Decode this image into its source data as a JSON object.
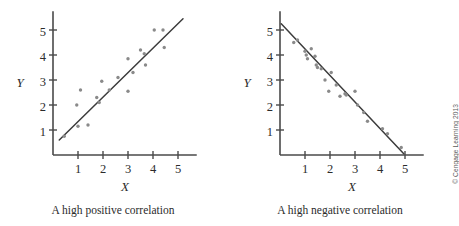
{
  "figure": {
    "background": "#ffffff",
    "axis_color": "#4a4a4a",
    "point_color": "#8a8a8a",
    "line_color": "#3c3c3c",
    "credit": "© Cengage Learning 2013"
  },
  "panels": [
    {
      "id": "left",
      "caption": "A high positive correlation",
      "xlabel": "X",
      "ylabel": "Y"
    },
    {
      "id": "right",
      "caption": "A high negative correlation",
      "xlabel": "X",
      "ylabel": "Y"
    }
  ],
  "chart_data": [
    {
      "type": "scatter",
      "title": "A high positive correlation",
      "xlabel": "X",
      "ylabel": "Y",
      "xlim": [
        0,
        5.6
      ],
      "ylim": [
        0,
        5.6
      ],
      "xticks": [
        "1",
        "2",
        "3",
        "4",
        "5"
      ],
      "yticks": [
        "1",
        "2",
        "3",
        "4",
        "5"
      ],
      "xtick_values": [
        1,
        2,
        3,
        4,
        5
      ],
      "ytick_values": [
        1,
        2,
        3,
        4,
        5
      ],
      "grid": false,
      "legend": false,
      "points": [
        [
          0.45,
          0.75
        ],
        [
          0.95,
          2.0
        ],
        [
          1.0,
          1.15
        ],
        [
          1.1,
          2.6
        ],
        [
          1.4,
          1.2
        ],
        [
          1.75,
          2.3
        ],
        [
          1.85,
          2.1
        ],
        [
          1.95,
          2.95
        ],
        [
          2.25,
          2.6
        ],
        [
          2.6,
          3.1
        ],
        [
          3.0,
          3.85
        ],
        [
          3.0,
          2.55
        ],
        [
          3.2,
          3.3
        ],
        [
          3.5,
          4.2
        ],
        [
          3.65,
          4.05
        ],
        [
          3.7,
          3.6
        ],
        [
          4.05,
          5.0
        ],
        [
          4.4,
          5.0
        ],
        [
          4.45,
          4.3
        ]
      ],
      "fit_line": {
        "x": [
          0.25,
          5.2
        ],
        "y": [
          0.6,
          5.45
        ],
        "description": "best-fit line, positive slope"
      }
    },
    {
      "type": "scatter",
      "title": "A high negative correlation",
      "xlabel": "X",
      "ylabel": "Y",
      "xlim": [
        0,
        5.6
      ],
      "ylim": [
        0,
        5.6
      ],
      "xticks": [
        "1",
        "2",
        "3",
        "4",
        "5"
      ],
      "yticks": [
        "1",
        "2",
        "3",
        "4",
        "5"
      ],
      "xtick_values": [
        1,
        2,
        3,
        4,
        5
      ],
      "ytick_values": [
        1,
        2,
        3,
        4,
        5
      ],
      "grid": false,
      "legend": false,
      "points": [
        [
          0.55,
          4.5
        ],
        [
          0.7,
          4.6
        ],
        [
          1.0,
          4.15
        ],
        [
          1.05,
          4.0
        ],
        [
          1.1,
          3.85
        ],
        [
          1.25,
          4.25
        ],
        [
          1.4,
          3.95
        ],
        [
          1.45,
          3.6
        ],
        [
          1.5,
          3.5
        ],
        [
          1.65,
          3.45
        ],
        [
          1.8,
          3.0
        ],
        [
          1.95,
          2.55
        ],
        [
          2.05,
          3.3
        ],
        [
          2.25,
          2.8
        ],
        [
          2.4,
          2.35
        ],
        [
          2.6,
          2.45
        ],
        [
          2.65,
          2.4
        ],
        [
          3.0,
          2.55
        ],
        [
          3.1,
          2.0
        ],
        [
          3.35,
          1.7
        ],
        [
          3.5,
          1.35
        ],
        [
          4.1,
          1.05
        ],
        [
          4.3,
          0.85
        ],
        [
          4.85,
          0.3
        ]
      ],
      "fit_line": {
        "x": [
          0.05,
          4.95
        ],
        "y": [
          5.25,
          0.05
        ],
        "description": "best-fit line, negative slope"
      }
    }
  ]
}
